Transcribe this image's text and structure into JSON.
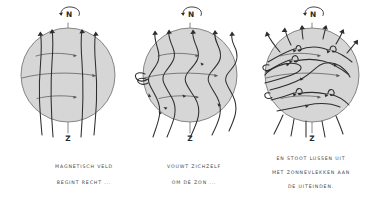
{
  "figure": {
    "title": "",
    "background_color": "#ffffff",
    "ink_color": "#2e2e2e",
    "sphere_fill_color": "#d6d6d6",
    "sphere_outline_color": "#6d6d6d",
    "caption_color": "#4a4a4a",
    "style": "hand-drawn-sketch"
  },
  "panels": [
    {
      "id": "panel-1",
      "name": "straight-field-panel",
      "north_pole_label": "N",
      "south_pole_label": "Z",
      "rotation_indicator": "curved-rotation-arrow",
      "caption_lines": [
        "MAGNETISCH VELD",
        "BEGINT RECHT ..."
      ],
      "field_line_count": 4,
      "latitude_line_count": 3,
      "field_line_shape": "straight-meridional",
      "center": {
        "x": 68,
        "y": 75
      },
      "radius": 47
    },
    {
      "id": "panel-2",
      "name": "wound-field-panel",
      "north_pole_label": "N",
      "south_pole_label": "Z",
      "rotation_indicator": "curved-rotation-arrow",
      "caption_lines": [
        "VOUWT ZICHZELF",
        "OM DE ZON ..."
      ],
      "field_line_count": 5,
      "latitude_line_count": 3,
      "field_line_shape": "wavy-wound",
      "center": {
        "x": 190,
        "y": 75
      },
      "radius": 47
    },
    {
      "id": "panel-3",
      "name": "loops-sunspots-panel",
      "north_pole_label": "N",
      "south_pole_label": "Z",
      "rotation_indicator": "curved-rotation-arrow",
      "caption_lines": [
        "EN STOOT LUSSEN UIT",
        "MET ZONNEVLEKKEN AAN",
        "DE UITEINDEN."
      ],
      "field_line_count": 5,
      "latitude_line_count": 3,
      "field_line_shape": "wavy-with-erupting-loops",
      "center": {
        "x": 312,
        "y": 75
      },
      "radius": 47
    }
  ]
}
